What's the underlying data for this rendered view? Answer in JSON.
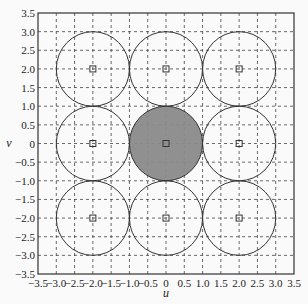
{
  "chart_data": {
    "type": "scatter",
    "title": "",
    "xlabel": "u",
    "ylabel": "v",
    "xlim": [
      -3.5,
      3.5
    ],
    "ylim": [
      -3.5,
      3.5
    ],
    "grid": true,
    "grid_style": "dashed",
    "legend": null,
    "xticks": [
      -3.5,
      -3.0,
      -2.5,
      -2.0,
      -1.5,
      -1.0,
      -0.5,
      0,
      0.5,
      1.0,
      1.5,
      2.0,
      2.5,
      3.0,
      3.5
    ],
    "xtick_labels": [
      "−3.5",
      "−3.0",
      "−2.5",
      "−2.0",
      "−1.5",
      "−1.0",
      "−0.5",
      "0",
      "0.5",
      "1.0",
      "1.5",
      "2.0",
      "2.5",
      "3.0",
      "3.5"
    ],
    "yticks": [
      3.5,
      3.0,
      2.5,
      2.0,
      1.5,
      1.0,
      0.5,
      0,
      -0.5,
      -1.0,
      -1.5,
      -2.0,
      -2.5,
      -3.0,
      -3.5
    ],
    "ytick_labels": [
      "3.5",
      "3.0",
      "2.5",
      "2.0",
      "1.5",
      "1.0",
      "0.5",
      "0",
      "−0.5",
      "−1.0",
      "−1.5",
      "−2.0",
      "−2.5",
      "−3.0",
      "−3.5"
    ],
    "circles": [
      {
        "cx": -2,
        "cy": 2,
        "r": 1,
        "filled": false
      },
      {
        "cx": 0,
        "cy": 2,
        "r": 1,
        "filled": false
      },
      {
        "cx": 2,
        "cy": 2,
        "r": 1,
        "filled": false
      },
      {
        "cx": -2,
        "cy": 0,
        "r": 1,
        "filled": false
      },
      {
        "cx": 0,
        "cy": 0,
        "r": 1,
        "filled": true
      },
      {
        "cx": 2,
        "cy": 0,
        "r": 1,
        "filled": false
      },
      {
        "cx": -2,
        "cy": -2,
        "r": 1,
        "filled": false
      },
      {
        "cx": 0,
        "cy": -2,
        "r": 1,
        "filled": false
      },
      {
        "cx": 2,
        "cy": -2,
        "r": 1,
        "filled": false
      }
    ],
    "center_markers": {
      "shape": "square",
      "points": [
        [
          -2,
          2
        ],
        [
          0,
          2
        ],
        [
          2,
          2
        ],
        [
          -2,
          0
        ],
        [
          0,
          0
        ],
        [
          2,
          0
        ],
        [
          -2,
          -2
        ],
        [
          0,
          -2
        ],
        [
          2,
          -2
        ]
      ]
    },
    "colors": {
      "fill": "#8a8a8a",
      "stroke": "#333333",
      "grid": "#444444",
      "background": "#fafafa"
    }
  }
}
